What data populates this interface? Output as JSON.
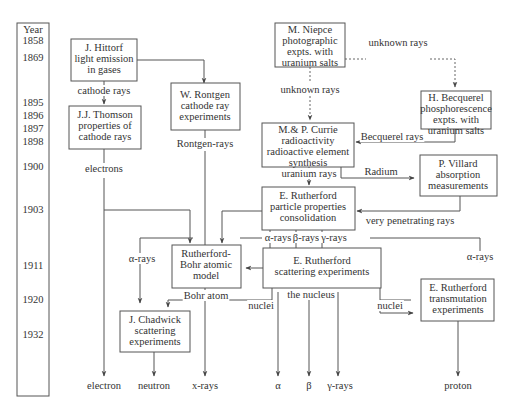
{
  "timeline": {
    "header": "Year",
    "years": [
      {
        "label": "1858",
        "y": 44
      },
      {
        "label": "1869",
        "y": 61
      },
      {
        "label": "1895",
        "y": 106
      },
      {
        "label": "1896",
        "y": 119
      },
      {
        "label": "1897",
        "y": 132
      },
      {
        "label": "1898",
        "y": 145
      },
      {
        "label": "1900",
        "y": 170
      },
      {
        "label": "1903",
        "y": 213
      },
      {
        "label": "1911",
        "y": 269
      },
      {
        "label": "1920",
        "y": 303
      },
      {
        "label": "1932",
        "y": 338
      }
    ]
  },
  "nodes": {
    "hittorf": {
      "lines": [
        "J. Hittorf",
        "light emission",
        "in  gases"
      ]
    },
    "thomson": {
      "lines": [
        "J.J. Thomson",
        "properties of",
        "cathode rays"
      ]
    },
    "rontgen": {
      "lines": [
        "W. Rontgen",
        "cathode ray",
        "experiments"
      ]
    },
    "niepce": {
      "lines": [
        "M. Niepce",
        "photographic",
        "expts. with",
        "uranium  salts"
      ]
    },
    "becquerel": {
      "lines": [
        "H. Becquerel",
        "phosphorescence",
        "expts. with",
        "uranium  salts"
      ]
    },
    "curie": {
      "lines": [
        "M.& P. Currie",
        "radioactivity",
        "radioactive element",
        "synthesis"
      ]
    },
    "villard": {
      "lines": [
        "P. Villard",
        "absorption",
        "measurements"
      ]
    },
    "rutherford_particle": {
      "lines": [
        "E. Rutherford",
        "particle properties",
        "consolidation"
      ]
    },
    "rutherford_bohr": {
      "lines": [
        "Rutherford-",
        "Bohr atomic",
        "model"
      ]
    },
    "rutherford_scattering": {
      "lines": [
        "E. Rutherford",
        "scattering experiments"
      ]
    },
    "chadwick": {
      "lines": [
        "J. Chadwick",
        "scattering",
        "experiments"
      ]
    },
    "rutherford_transmutation": {
      "lines": [
        "E. Rutherford",
        "transmutation",
        "experiments"
      ]
    }
  },
  "edge_labels": {
    "cathode_rays": "cathode rays",
    "unknown_rays_horizontal": "unknown rays",
    "unknown_rays_vertical": "unknown rays",
    "rontgen_rays": "Rontgen-rays",
    "becquerel_rays": "Becquerel rays",
    "electrons": "electrons",
    "radium": "Radium",
    "uranium_rays": "uranium rays",
    "very_penetrating_rays": "very penetrating rays",
    "alpha_rays_bar": "α-rays",
    "beta_rays_bar": "β-rays",
    "gamma_rays_bar": "γ-rays",
    "alpha_rays_left": "α-rays",
    "alpha_rays_right": "α-rays",
    "bohr_atom": "Bohr atom",
    "the_nucleus": "the nucleus",
    "nuclei_left": "nuclei",
    "nuclei_right": "nuclei"
  },
  "outputs": {
    "electron": "electron",
    "neutron": "neutron",
    "x_rays": "x-rays",
    "alpha": "α",
    "beta": "β",
    "gamma_rays": "γ-rays",
    "proton": "proton"
  },
  "colors": {
    "stroke": "#555555",
    "text": "#333333",
    "background": "#ffffff"
  }
}
